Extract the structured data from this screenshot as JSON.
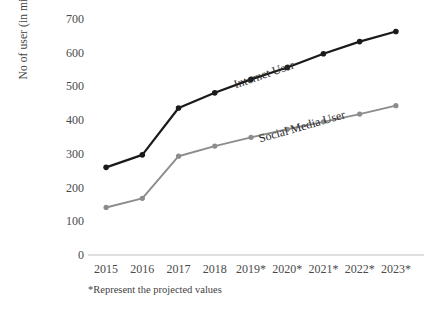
{
  "chart_data": {
    "type": "line",
    "title": "",
    "xlabel": "",
    "ylabel": "No of user (in millions)",
    "categories": [
      "2015",
      "2016",
      "2017",
      "2018",
      "2019*",
      "2020*",
      "2021*",
      "2022*",
      "2023*"
    ],
    "series": [
      {
        "name": "Internet User",
        "color": "#1a1a1a",
        "values": [
          260,
          297,
          436,
          481,
          521,
          556,
          597,
          633,
          663
        ]
      },
      {
        "name": "Social Media User",
        "color": "#8c8c8c",
        "values": [
          141,
          168,
          293,
          323,
          349,
          373,
          395,
          418,
          443
        ]
      }
    ],
    "ylim": [
      0,
      700
    ],
    "yticks": [
      0,
      100,
      200,
      300,
      400,
      500,
      600,
      700
    ],
    "ytick_labels": [
      "0",
      "100",
      "200",
      "300",
      "400",
      "500",
      "600",
      "700"
    ],
    "grid": false,
    "legend_position": "inline-along-lines",
    "annotations": [
      {
        "text": "*Represent the projected values"
      }
    ],
    "axis_color": "#bfbfbf"
  },
  "footnote": "*Represent the projected values",
  "series_labels": {
    "internet": "Internet User",
    "social": "Social Media User"
  }
}
